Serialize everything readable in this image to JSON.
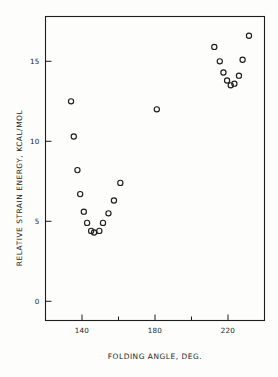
{
  "chart_data": {
    "type": "scatter",
    "title": "",
    "xlabel": "FOLDING ANGLE, DEG.",
    "ylabel": "RELATIVE STRAIN ENERGY, KCAL/MOL",
    "xlim": [
      120,
      240
    ],
    "ylim": [
      -1.2,
      17.8
    ],
    "grid": false,
    "legend": null,
    "marker_style": "open-circle",
    "x_ticks": [
      120,
      140,
      160,
      180,
      200,
      220,
      240
    ],
    "x_tick_labels": [
      "",
      "140",
      "",
      "180",
      "",
      "220",
      ""
    ],
    "y_ticks": [
      0,
      5,
      10,
      15
    ],
    "y_tick_labels": [
      "0",
      "5",
      "10",
      "15"
    ],
    "series": [
      {
        "name": "Relative strain energy",
        "points": [
          {
            "x": 134.0,
            "y": 12.5
          },
          {
            "x": 135.5,
            "y": 10.3
          },
          {
            "x": 137.5,
            "y": 8.2
          },
          {
            "x": 139.0,
            "y": 6.7
          },
          {
            "x": 141.0,
            "y": 5.6
          },
          {
            "x": 142.8,
            "y": 4.9
          },
          {
            "x": 145.0,
            "y": 4.4
          },
          {
            "x": 146.6,
            "y": 4.3
          },
          {
            "x": 149.5,
            "y": 4.4
          },
          {
            "x": 151.5,
            "y": 4.9
          },
          {
            "x": 154.5,
            "y": 5.5
          },
          {
            "x": 157.5,
            "y": 6.3
          },
          {
            "x": 161.0,
            "y": 7.4
          },
          {
            "x": 181.0,
            "y": 12.0
          },
          {
            "x": 212.5,
            "y": 15.9
          },
          {
            "x": 215.5,
            "y": 15.0
          },
          {
            "x": 217.5,
            "y": 14.3
          },
          {
            "x": 219.5,
            "y": 13.8
          },
          {
            "x": 221.5,
            "y": 13.5
          },
          {
            "x": 223.5,
            "y": 13.6
          },
          {
            "x": 226.0,
            "y": 14.1
          },
          {
            "x": 228.0,
            "y": 15.1
          },
          {
            "x": 231.5,
            "y": 16.6
          }
        ]
      }
    ]
  },
  "figure": {
    "caption": ""
  }
}
